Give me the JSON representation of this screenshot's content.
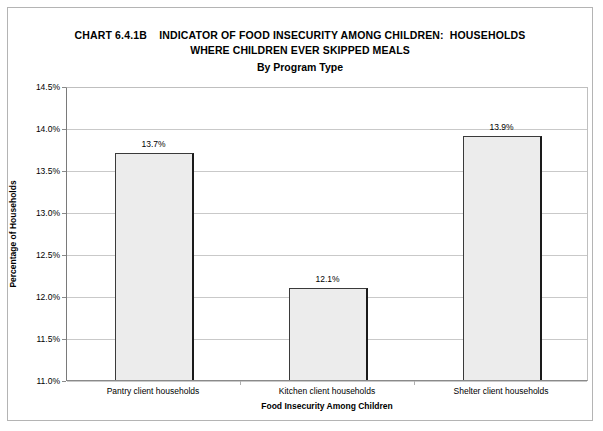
{
  "title": {
    "line1": "CHART 6.4.1B    INDICATOR OF FOOD INSECURITY AMONG CHILDREN:  HOUSEHOLDS",
    "line2": "WHERE CHILDREN EVER SKIPPED MEALS",
    "subtitle": "By Program Type"
  },
  "chart_data": {
    "type": "bar",
    "title": "CHART 6.4.1B    INDICATOR OF FOOD INSECURITY AMONG CHILDREN:  HOUSEHOLDS WHERE CHILDREN EVER SKIPPED MEALS",
    "subtitle": "By Program Type",
    "categories": [
      "Pantry client households",
      "Kitchen client households",
      "Shelter client households"
    ],
    "values": [
      13.7,
      12.1,
      13.9
    ],
    "value_labels": [
      "13.7%",
      "12.1%",
      "13.9%"
    ],
    "xlabel": "Food Insecurity Among Children",
    "ylabel": "Percentage of Households",
    "ylim": [
      11.0,
      14.5
    ],
    "ytick_values": [
      11.0,
      11.5,
      12.0,
      12.5,
      13.0,
      13.5,
      14.0,
      14.5
    ],
    "ytick_labels": [
      "11.0%",
      "11.5%",
      "12.0%",
      "12.5%",
      "13.0%",
      "13.5%",
      "14.0%",
      "14.5%"
    ],
    "grid": true,
    "legend": null,
    "series": [
      {
        "name": "Percentage of Households",
        "values": [
          13.7,
          12.1,
          13.9
        ]
      }
    ],
    "colors": {
      "bar_fill": "#ececec",
      "bar_border": "#3a3a3a",
      "gridline": "#c9c9c9",
      "frame": "#b4b4b4",
      "text": "#000000"
    }
  }
}
